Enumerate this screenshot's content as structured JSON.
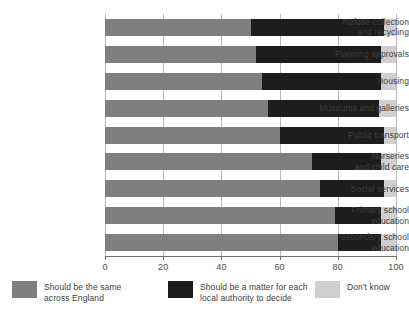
{
  "chart_data": {
    "type": "bar",
    "orientation": "horizontal",
    "stacked": true,
    "title": "",
    "xlabel": "",
    "ylabel": "",
    "xlim": [
      0,
      100
    ],
    "xticks": [
      0,
      20,
      40,
      60,
      80,
      100
    ],
    "xtick_labels": [
      "0",
      "20",
      "40",
      "60",
      "80",
      "100"
    ],
    "grid": true,
    "grid_axis": "x",
    "legend_position": "bottom",
    "categories": [
      "Refuse collection and recycling",
      "Planning approvals",
      "Housing",
      "Museums and galleries",
      "Public transport",
      "Nurseries and child care",
      "Social services",
      "Primary school education",
      "Secondary school education"
    ],
    "category_lines": [
      [
        "Refuse collection",
        "and recycling"
      ],
      [
        "Planning approvals"
      ],
      [
        "Housing"
      ],
      [
        "Museums and galleries"
      ],
      [
        "Public transport"
      ],
      [
        "Nurseries",
        "and child care"
      ],
      [
        "Social services"
      ],
      [
        "Primary school",
        "education"
      ],
      [
        "Secondary school",
        "education"
      ]
    ],
    "series": [
      {
        "name": "Should be the same across England",
        "color": "#7f7f7f",
        "values": [
          50,
          52,
          54,
          56,
          60,
          71,
          74,
          79,
          80
        ]
      },
      {
        "name": "Should be a matter for each local authority to decide",
        "color": "#1d1d1d",
        "values": [
          46,
          43,
          41,
          38,
          36,
          24,
          22,
          16,
          15
        ]
      },
      {
        "name": "Don't know",
        "color": "#cfcfcf",
        "values": [
          4,
          5,
          5,
          6,
          4,
          5,
          4,
          5,
          5
        ]
      }
    ]
  },
  "legend": {
    "items": [
      {
        "lines": [
          "Should be the same",
          "across England"
        ],
        "color": "#7f7f7f"
      },
      {
        "lines": [
          "Should be a matter for each",
          "local authority to decide"
        ],
        "color": "#1d1d1d"
      },
      {
        "lines": [
          "Don't know"
        ],
        "color": "#cfcfcf"
      }
    ]
  }
}
